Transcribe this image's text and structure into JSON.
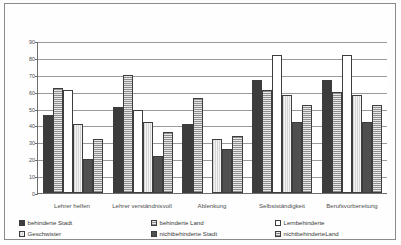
{
  "chart_data": {
    "type": "bar",
    "title": "",
    "xlabel": "",
    "ylabel": "",
    "ylim": [
      0,
      90
    ],
    "yticks": [
      0,
      10,
      20,
      30,
      40,
      50,
      60,
      70,
      80,
      90
    ],
    "grid": true,
    "legend_position": "bottom",
    "categories": [
      "Lehrer helfen",
      "Lehrer verständnisvoll",
      "Ablenkung",
      "Selbstständigkeit",
      "Berufsvorbereitung"
    ],
    "series": [
      {
        "name": "behinderte Stadt",
        "values": [
          46,
          51,
          41,
          67,
          67
        ]
      },
      {
        "name": "behinderte Land",
        "values": [
          62,
          70,
          56,
          61,
          60
        ]
      },
      {
        "name": "Lernbehinderte",
        "values": [
          61,
          49,
          null,
          82,
          82
        ]
      },
      {
        "name": "Geschwister",
        "values": [
          41,
          42,
          32,
          58,
          58
        ]
      },
      {
        "name": "nichtbehinderte Stadt",
        "values": [
          20,
          22,
          26,
          42,
          42
        ]
      },
      {
        "name": "nichtbehinderteLand",
        "values": [
          32,
          36,
          34,
          52,
          52
        ]
      }
    ]
  },
  "legend": {
    "items": [
      {
        "label": "behinderte Stadt",
        "swatch": "solid-dark"
      },
      {
        "label": "behinderte Land",
        "swatch": "checker"
      },
      {
        "label": "Lernbehinderte",
        "swatch": "white"
      },
      {
        "label": "Geschwister",
        "swatch": "light-lines"
      },
      {
        "label": "nichtbehinderte Stadt",
        "swatch": "solid-gray"
      },
      {
        "label": "nichtbehinderteLand",
        "swatch": "checker"
      }
    ]
  },
  "colors": {
    "series0": "#3c3c3c",
    "series1": "#c9c9c9",
    "series2": "#ffffff",
    "series3": "#ededed",
    "series4": "#4f4f4f",
    "series5": "#c9c9c9",
    "grid": "#9b9b9b",
    "axis": "#6d6d6d",
    "text": "#3a3a3a",
    "frame": "#8a8a8a"
  }
}
